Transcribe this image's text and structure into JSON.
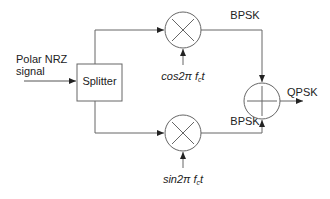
{
  "diagram": {
    "type": "block-diagram",
    "input_label_line1": "Polar NRZ",
    "input_label_line2": "signal",
    "splitter_label": "Splitter",
    "top_carrier": {
      "prefix": "cos2",
      "pi": "π",
      "f": " f",
      "sub": "c",
      "t": "t"
    },
    "bottom_carrier": {
      "prefix": "sin2",
      "pi": "π",
      "f": " f",
      "sub": "c",
      "t": "t"
    },
    "top_branch_label": "BPSK",
    "bottom_branch_label": "BPSK",
    "output_label": "QPSK",
    "nodes": [
      {
        "id": "splitter",
        "kind": "box",
        "label": "Splitter"
      },
      {
        "id": "mult-top",
        "kind": "multiplier",
        "symbol": "×"
      },
      {
        "id": "mult-bottom",
        "kind": "multiplier",
        "symbol": "×"
      },
      {
        "id": "adder",
        "kind": "summer",
        "symbol": "+"
      }
    ],
    "colors": {
      "stroke": "#555555",
      "text": "#222222",
      "background": "#ffffff"
    }
  }
}
